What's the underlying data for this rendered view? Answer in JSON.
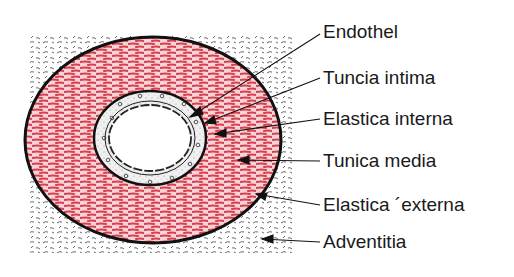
{
  "figure": {
    "type": "cross-section of artery wall",
    "colors": {
      "media": "#d9404f",
      "outline": "#111111",
      "adventitia_strokes": "#555555",
      "intima_fill": "#eeeeee"
    }
  },
  "labels": [
    {
      "id": "endothel",
      "text": "Endothel",
      "y": 21
    },
    {
      "id": "tunica-intima",
      "text": "Tuncia intima",
      "y": 67
    },
    {
      "id": "elastica-interna",
      "text": "Elastica interna",
      "y": 108
    },
    {
      "id": "tunica-media",
      "text": "Tunica media",
      "y": 150
    },
    {
      "id": "elastica-externa",
      "text": "Elastica ´externa",
      "y": 194
    },
    {
      "id": "adventitia",
      "text": "Adventitia",
      "y": 231
    }
  ]
}
